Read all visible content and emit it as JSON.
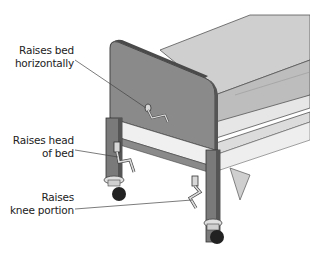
{
  "diagram": {
    "labels": [
      {
        "id": "raises-bed-horizontally",
        "lines": [
          "Raises bed",
          "horizontally"
        ]
      },
      {
        "id": "raises-head-of-bed",
        "lines": [
          "Raises head",
          "of bed"
        ]
      },
      {
        "id": "raises-knee-portion",
        "lines": [
          "Raises",
          "knee portion"
        ]
      }
    ],
    "colors": {
      "headboard": "#8a8a8a",
      "headboard_edge": "#555555",
      "mattress": "#c8c8c8",
      "frame": "#e6e6e6",
      "legs": "#7a7a7a",
      "wheels": "#222222",
      "crank": "#d8d8d8",
      "leader_line": "#444444"
    }
  }
}
